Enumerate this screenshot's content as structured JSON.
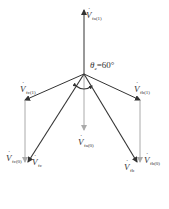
{
  "diagram": {
    "type": "phasor-diagram",
    "angle_label": {
      "symbol": "θ",
      "subscript": "e",
      "text": "=60°"
    },
    "vectors": [
      {
        "id": "fa1",
        "base": "V",
        "subscript": "fa(1)",
        "style": "dark"
      },
      {
        "id": "fb1",
        "base": "V",
        "subscript": "fb(1)",
        "style": "dark"
      },
      {
        "id": "fc1",
        "base": "V",
        "subscript": "fc(1)",
        "style": "dark"
      },
      {
        "id": "fa0",
        "base": "V",
        "subscript": "fa(0)",
        "style": "light"
      },
      {
        "id": "fb0",
        "base": "V",
        "subscript": "fb(0)",
        "style": "light"
      },
      {
        "id": "fc0",
        "base": "V",
        "subscript": "fc(0)",
        "style": "light"
      },
      {
        "id": "fb",
        "base": "V",
        "subscript": "fb",
        "style": "dark"
      },
      {
        "id": "fc",
        "base": "V",
        "subscript": "fc",
        "style": "dark"
      }
    ],
    "colors": {
      "dark": "#333333",
      "light": "#aaaaaa"
    }
  }
}
